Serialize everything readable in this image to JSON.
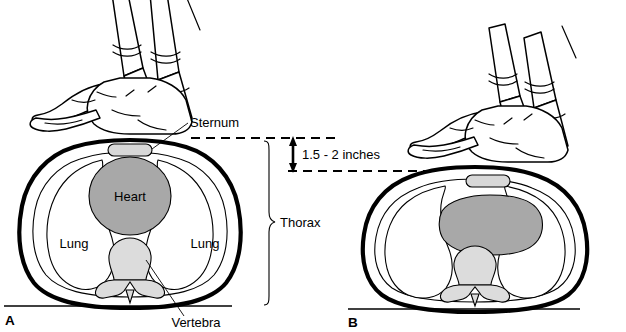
{
  "figure": {
    "panels": [
      {
        "letter": "A",
        "caption_state": "uncompressed",
        "labels": {
          "sternum": "Sternum",
          "heart": "Heart",
          "lung_left": "Lung",
          "lung_right": "Lung",
          "vertebra": "Vertebra",
          "thorax": "Thorax"
        }
      },
      {
        "letter": "B",
        "caption_state": "compressed",
        "labels": {}
      }
    ],
    "measurement": {
      "value": "1.5 - 2 inches",
      "description": "compression depth between uncompressed and compressed sternum level"
    },
    "colors": {
      "heart_fill": "#a8a8a8",
      "vertebra_fill": "#dcdcdc",
      "sternum_fill": "#d8d8d8",
      "outline": "#000000",
      "background": "#ffffff"
    }
  }
}
